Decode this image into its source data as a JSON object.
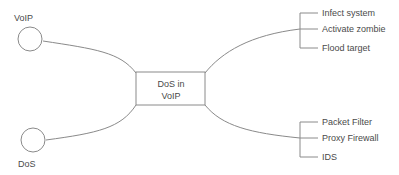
{
  "diagram": {
    "type": "concept-map",
    "colors": {
      "background": "#ffffff",
      "stroke": "#8a8a8a",
      "text": "#4a4a4a"
    },
    "center_node": {
      "label_line1": "DoS in",
      "label_line2": "VoIP"
    },
    "source_nodes": [
      {
        "id": "voip",
        "label": "VoIP",
        "label_position": "above"
      },
      {
        "id": "dos",
        "label": "DoS",
        "label_position": "below"
      }
    ],
    "branch_groups": [
      {
        "id": "attack-steps",
        "position": "top-right",
        "items": [
          {
            "label": "Infect system"
          },
          {
            "label": "Activate zombie"
          },
          {
            "label": "Flood target"
          }
        ]
      },
      {
        "id": "defenses",
        "position": "bottom-right",
        "items": [
          {
            "label": "Packet Filter"
          },
          {
            "label": "Proxy Firewall"
          },
          {
            "label": "IDS"
          }
        ]
      }
    ]
  }
}
